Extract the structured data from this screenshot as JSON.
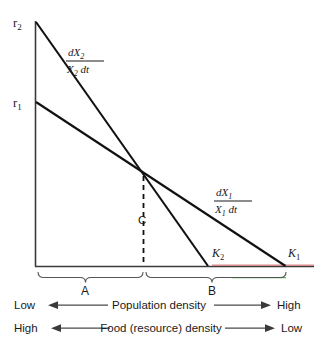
{
  "figure": {
    "kind": "population-growth-rate-diagram",
    "background_color": "#ffffff",
    "line_color": "#111111",
    "axis_color": "#3a3a3a",
    "accent_red": "#d98a8a",
    "accent_green": "#4fb84f"
  },
  "axis_labels": {
    "r2": {
      "base": "r",
      "sub": "2"
    },
    "r1": {
      "base": "r",
      "sub": "1"
    }
  },
  "curves": [
    {
      "id": "dx2",
      "label_numerator_base": "dX",
      "label_numerator_sub": "2",
      "label_denominator_base": "X",
      "label_denominator_sub": "2",
      "label_denominator_tail": " dt",
      "start_label": "r2",
      "end_label": "K2"
    },
    {
      "id": "dx1",
      "label_numerator_base": "dX",
      "label_numerator_sub": "1",
      "label_denominator_base": "X",
      "label_denominator_sub": "1",
      "label_denominator_tail": " dt",
      "start_label": "r1",
      "end_label": "K1"
    }
  ],
  "points": {
    "intersection": {
      "label": "C"
    },
    "k2": {
      "base": "K",
      "sub": "2"
    },
    "k1": {
      "base": "K",
      "sub": "1"
    }
  },
  "braces": [
    {
      "id": "brace-a",
      "label": "A"
    },
    {
      "id": "brace-b",
      "label": "B"
    }
  ],
  "scales": [
    {
      "id": "population-density",
      "left_label": "Low",
      "caption": "Population density",
      "right_label": "High"
    },
    {
      "id": "food-resource-density",
      "left_label": "High",
      "caption": "Food (resource) density",
      "right_label": "Low"
    }
  ]
}
